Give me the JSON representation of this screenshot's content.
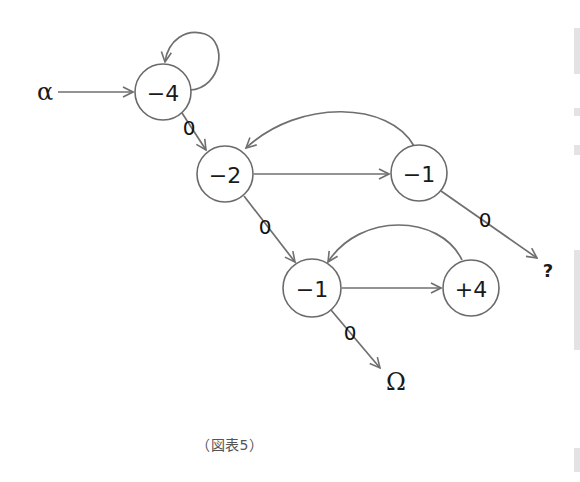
{
  "figure": {
    "caption": "（図表5）",
    "start_symbol": "α",
    "end_symbol": "Ω",
    "unknown_symbol": "?"
  },
  "nodes": [
    {
      "id": "n1",
      "label": "−4",
      "cx": 163,
      "cy": 92,
      "r": 28
    },
    {
      "id": "n2",
      "label": "−2",
      "cx": 225,
      "cy": 174,
      "r": 28
    },
    {
      "id": "n3",
      "label": "−1",
      "cx": 419,
      "cy": 173,
      "r": 28
    },
    {
      "id": "n4",
      "label": "−1",
      "cx": 312,
      "cy": 288,
      "r": 29
    },
    {
      "id": "n5",
      "label": "+4",
      "cx": 471,
      "cy": 288,
      "r": 28
    }
  ],
  "edges": [
    {
      "from": "α",
      "to": "n1",
      "label": ""
    },
    {
      "from": "n1",
      "to": "n1",
      "label": "",
      "type": "self-loop"
    },
    {
      "from": "n1",
      "to": "n2",
      "label": "0"
    },
    {
      "from": "n2",
      "to": "n3",
      "label": ""
    },
    {
      "from": "n3",
      "to": "n2",
      "label": "",
      "type": "curved-back"
    },
    {
      "from": "n2",
      "to": "n4",
      "label": "0"
    },
    {
      "from": "n3",
      "to": "?",
      "label": "0"
    },
    {
      "from": "n4",
      "to": "n5",
      "label": ""
    },
    {
      "from": "n5",
      "to": "n4",
      "label": "",
      "type": "curved-back"
    },
    {
      "from": "n4",
      "to": "Ω",
      "label": "0"
    }
  ],
  "edge_labels": {
    "n1_n2": "0",
    "n2_n4": "0",
    "n3_q": "0",
    "n4_omega": "0"
  },
  "colors": {
    "stroke": "#6f6f6f",
    "text": "#1a1a1a",
    "caption": "#555555",
    "background": "#ffffff"
  }
}
